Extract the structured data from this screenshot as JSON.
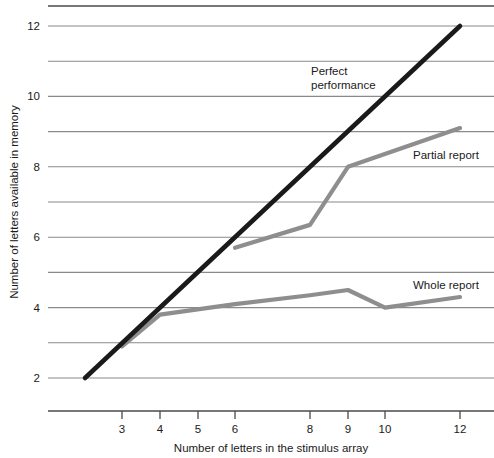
{
  "chart_data": {
    "type": "line",
    "title": "",
    "xlabel": "Number of letters in the stimulus array",
    "ylabel": "Number of letters available in memory",
    "x_tick_labels": [
      "3",
      "4",
      "5",
      "6",
      "8",
      "9",
      "10",
      "12"
    ],
    "y_tick_labels": [
      "2",
      "4",
      "6",
      "8",
      "10",
      "12"
    ],
    "xlim": [
      2,
      12
    ],
    "ylim": [
      2,
      12
    ],
    "grid": "horizontal",
    "legend_position": "inline-annotations",
    "series": [
      {
        "name": "Perfect performance",
        "label": "Perfect",
        "label_line2": "performance",
        "color": "#1a1a1a",
        "x": [
          2,
          12
        ],
        "values": [
          2,
          12
        ]
      },
      {
        "name": "Partial report",
        "label": "Partial report",
        "color": "#8e8e8e",
        "x": [
          6,
          8,
          9,
          12
        ],
        "values": [
          5.7,
          6.35,
          8.0,
          9.1
        ]
      },
      {
        "name": "Whole report",
        "label": "Whole report",
        "color": "#8e8e8e",
        "x": [
          3,
          4,
          6,
          8,
          9,
          10,
          12
        ],
        "values": [
          2.9,
          3.8,
          4.1,
          4.35,
          4.5,
          4.0,
          4.3
        ]
      }
    ]
  },
  "axes": {
    "y_title": "Number of letters available in memory",
    "x_title": "Number of letters in the stimulus array"
  },
  "annotations": {
    "perfect_line1": "Perfect",
    "perfect_line2": "performance",
    "partial": "Partial report",
    "whole": "Whole report"
  },
  "ticks": {
    "y": [
      "12",
      "10",
      "8",
      "6",
      "4",
      "2"
    ],
    "x": [
      "3",
      "4",
      "5",
      "6",
      "8",
      "9",
      "10",
      "12"
    ]
  },
  "colors": {
    "perfect": "#1a1a1a",
    "partial": "#8e8e8e",
    "whole": "#8e8e8e",
    "grid": "#8a8a8a",
    "axis": "#4a4a4a",
    "background": "#ffffff"
  }
}
